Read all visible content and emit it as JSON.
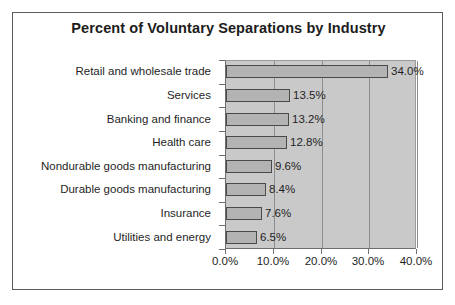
{
  "chart_data": {
    "type": "bar",
    "orientation": "horizontal",
    "title": "Percent of Voluntary Separations by Industry",
    "xlabel": "",
    "ylabel": "",
    "categories": [
      "Retail and wholesale trade",
      "Services",
      "Banking and finance",
      "Health care",
      "Nondurable goods manufacturing",
      "Durable goods manufacturing",
      "Insurance",
      "Utilities and energy"
    ],
    "values": [
      34.0,
      13.5,
      13.2,
      12.8,
      9.6,
      8.4,
      7.6,
      6.5
    ],
    "value_labels": [
      "34.0%",
      "13.5%",
      "13.2%",
      "12.8%",
      "9.6%",
      "8.4%",
      "7.6%",
      "6.5%"
    ],
    "xlim": [
      0,
      40
    ],
    "xticks": [
      0,
      10,
      20,
      30,
      40
    ],
    "xtick_labels": [
      "0.0%",
      "10.0%",
      "20.0%",
      "30.0%",
      "40.0%"
    ],
    "grid": true,
    "grid_axis": "x",
    "legend": false,
    "colors": {
      "bar_fill": "#b3b3b3",
      "bar_border": "#4a4a4a",
      "plot_background": "#c9c9c9",
      "gridline": "#8d8d8d",
      "chart_background": "#ffffff",
      "frame_border": "#5b5b5b",
      "text": "#1f1f1f"
    }
  }
}
